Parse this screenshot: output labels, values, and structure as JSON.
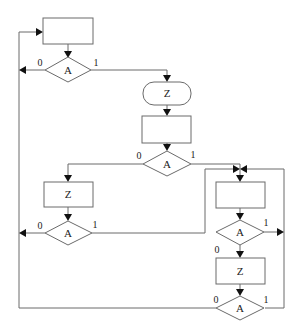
{
  "diagram": {
    "type": "flowchart",
    "nodes": {
      "box_top": {
        "label": ""
      },
      "decision_1": {
        "label": "A",
        "branch_no": "0",
        "branch_yes": "1"
      },
      "terminal_z": {
        "label": "Z"
      },
      "box_mid": {
        "label": ""
      },
      "decision_2": {
        "label": "A",
        "branch_no": "0",
        "branch_yes": "1"
      },
      "box_left_z": {
        "label": "Z"
      },
      "decision_left": {
        "label": "A",
        "branch_no": "0",
        "branch_yes": "1"
      },
      "box_right_top": {
        "label": ""
      },
      "decision_right_1": {
        "label": "A",
        "branch_no": "0",
        "branch_yes": "1"
      },
      "box_right_z": {
        "label": "Z"
      },
      "decision_right_2": {
        "label": "A",
        "branch_no": "0",
        "branch_yes": "1"
      }
    },
    "colors": {
      "line": "#6a6a6a",
      "arrow": "#111111",
      "text": "#222222",
      "background": "#ffffff"
    }
  }
}
